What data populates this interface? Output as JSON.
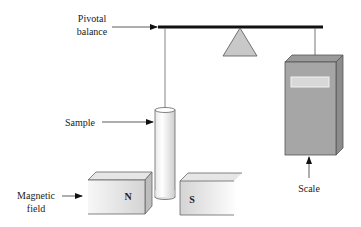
{
  "diagram": {
    "labels": {
      "pivotal_balance_line1": "Pivotal",
      "pivotal_balance_line2": "balance",
      "sample": "Sample",
      "magnetic_field_line1": "Magnetic",
      "magnetic_field_line2": "field",
      "scale": "Scale"
    },
    "magnets": {
      "north": "N",
      "south": "S"
    },
    "components": [
      "pivotal-balance-beam",
      "pivot-triangle",
      "sample-tube",
      "magnet-north",
      "magnet-south",
      "scale-box"
    ],
    "colors": {
      "beam": "#111111",
      "pivot_fill": "#c8c8c8",
      "scale_front": "#a6a6a6",
      "scale_top": "#9a9a9a",
      "scale_side": "#8c8c8c",
      "scale_display": "#d8d8d8",
      "magnet_light": "#f4f4f4",
      "magnet_dark": "#d0d0d0",
      "line": "#555555"
    }
  }
}
